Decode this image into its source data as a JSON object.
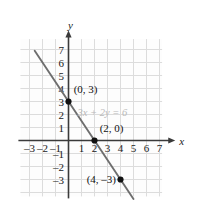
{
  "figure": {
    "background_color": "#fdfdfd",
    "grid_color": "#dcdcdc",
    "axis_color": "#3a3a3a",
    "line_color": "#6e6e6e",
    "point_color": "#111111",
    "equation_label_color": "#b9b9b9"
  },
  "chart_data": {
    "type": "line",
    "title": "",
    "xlabel": "x",
    "ylabel": "y",
    "equation": "3x + 2y = 6",
    "grid": true,
    "legend": "none",
    "xlim": [
      -3.7,
      7.7
    ],
    "ylim": [
      -3.8,
      7.8
    ],
    "x_ticks": [
      -3,
      -2,
      -1,
      1,
      2,
      3,
      4,
      5,
      6,
      7
    ],
    "x_tick_labels": [
      "–3",
      "–2",
      "–1",
      "1",
      "2",
      "3",
      "4",
      "5",
      "6",
      "7"
    ],
    "y_ticks": [
      -3,
      -2,
      -1,
      1,
      2,
      3,
      4,
      5,
      6,
      7
    ],
    "y_tick_labels": [
      "–3",
      "–2",
      "–1",
      "1",
      "2",
      "3",
      "4",
      "5",
      "6",
      "7"
    ],
    "series": [
      {
        "name": "3x + 2y = 6",
        "slope": -1.5,
        "intercept": 3,
        "x": [
          -2.6,
          5.0
        ],
        "y": [
          6.9,
          -4.5
        ]
      }
    ],
    "points": [
      {
        "label": "(0, 3)",
        "x": 0,
        "y": 3,
        "label_dx": 0.4,
        "label_dy": 1.0
      },
      {
        "label": "(2, 0)",
        "x": 2,
        "y": 0,
        "label_dx": 0.4,
        "label_dy": 1.0
      },
      {
        "label": "(4, –3)",
        "x": 4,
        "y": -3,
        "label_dx": -2.6,
        "label_dy": 0.05
      }
    ],
    "annotations": [
      {
        "text": "3x + 2y = 6",
        "x": 2.6,
        "y": 1.85
      }
    ]
  },
  "axis_labels": {
    "x": "x",
    "y": "y"
  }
}
